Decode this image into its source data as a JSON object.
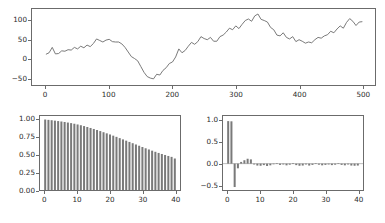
{
  "figure": {
    "background_color": "#ffffff",
    "line_color": "#6b6b6b",
    "bar_color": "#7a7a7a",
    "axis_color": "#6b6b6b",
    "tick_text_color": "#2b2b2b"
  },
  "chart_data": [
    {
      "type": "line",
      "name": "time-series",
      "title": "",
      "xlabel": "",
      "ylabel": "",
      "xlim": [
        -22,
        520
      ],
      "ylim": [
        -68,
        130
      ],
      "xticks": [
        0,
        100,
        200,
        300,
        400,
        500
      ],
      "yticks": [
        -50,
        0,
        50,
        100
      ],
      "xtick_labels": [
        "0",
        "100",
        "200",
        "300",
        "400",
        "500"
      ],
      "ytick_labels": [
        "−50",
        "0",
        "50",
        "100"
      ],
      "grid": false,
      "legend": null,
      "x": [
        0,
        5,
        10,
        15,
        20,
        25,
        30,
        35,
        40,
        45,
        50,
        55,
        60,
        65,
        70,
        75,
        80,
        85,
        90,
        95,
        100,
        105,
        110,
        115,
        120,
        125,
        130,
        135,
        140,
        145,
        150,
        155,
        160,
        165,
        170,
        175,
        180,
        185,
        190,
        195,
        200,
        205,
        210,
        215,
        220,
        225,
        230,
        235,
        240,
        245,
        250,
        255,
        260,
        265,
        270,
        275,
        280,
        285,
        290,
        295,
        300,
        305,
        310,
        315,
        320,
        325,
        330,
        335,
        340,
        345,
        350,
        355,
        360,
        365,
        370,
        375,
        380,
        385,
        390,
        395,
        400,
        405,
        410,
        415,
        420,
        425,
        430,
        435,
        440,
        445,
        450,
        455,
        460,
        465,
        470,
        475,
        480,
        485,
        490,
        495,
        500
      ],
      "y": [
        12,
        16,
        30,
        13,
        14,
        21,
        20,
        24,
        23,
        30,
        26,
        33,
        29,
        36,
        32,
        40,
        52,
        48,
        44,
        49,
        51,
        45,
        44,
        44,
        39,
        30,
        18,
        6,
        1,
        -5,
        -20,
        -35,
        -46,
        -50,
        -52,
        -40,
        -42,
        -30,
        -23,
        -12,
        -8,
        5,
        26,
        16,
        22,
        33,
        43,
        38,
        45,
        58,
        53,
        50,
        56,
        46,
        46,
        58,
        62,
        70,
        80,
        76,
        86,
        79,
        90,
        100,
        104,
        98,
        112,
        117,
        103,
        100,
        96,
        82,
        76,
        62,
        60,
        68,
        56,
        52,
        58,
        45,
        50,
        46,
        41,
        44,
        42,
        50,
        56,
        54,
        60,
        63,
        72,
        68,
        78,
        86,
        80,
        95,
        105,
        98,
        87,
        96,
        97
      ]
    },
    {
      "type": "bar",
      "name": "acf",
      "title": "",
      "xlabel": "",
      "ylabel": "",
      "xlim": [
        -1.6,
        41.6
      ],
      "ylim": [
        0.0,
        1.05
      ],
      "xticks": [
        0,
        10,
        20,
        30,
        40
      ],
      "yticks": [
        0.0,
        0.25,
        0.5,
        0.75,
        1.0
      ],
      "xtick_labels": [
        "0",
        "10",
        "20",
        "30",
        "40"
      ],
      "ytick_labels": [
        "0.00",
        "0.25",
        "0.50",
        "0.75",
        "1.00"
      ],
      "grid": false,
      "legend": null,
      "categories": [
        0,
        1,
        2,
        3,
        4,
        5,
        6,
        7,
        8,
        9,
        10,
        11,
        12,
        13,
        14,
        15,
        16,
        17,
        18,
        19,
        20,
        21,
        22,
        23,
        24,
        25,
        26,
        27,
        28,
        29,
        30,
        31,
        32,
        33,
        34,
        35,
        36,
        37,
        38,
        39,
        40
      ],
      "values": [
        1.0,
        0.995,
        0.99,
        0.984,
        0.978,
        0.972,
        0.965,
        0.957,
        0.949,
        0.94,
        0.93,
        0.919,
        0.907,
        0.894,
        0.88,
        0.866,
        0.851,
        0.836,
        0.82,
        0.804,
        0.788,
        0.771,
        0.754,
        0.736,
        0.718,
        0.7,
        0.682,
        0.664,
        0.646,
        0.628,
        0.61,
        0.592,
        0.575,
        0.558,
        0.542,
        0.526,
        0.511,
        0.497,
        0.483,
        0.47,
        0.447
      ]
    },
    {
      "type": "bar",
      "name": "pacf",
      "title": "",
      "xlabel": "",
      "ylabel": "",
      "xlim": [
        -1.6,
        41.6
      ],
      "ylim": [
        -0.62,
        1.12
      ],
      "xticks": [
        0,
        10,
        20,
        30,
        40
      ],
      "yticks": [
        -0.5,
        0.0,
        0.5,
        1.0
      ],
      "xtick_labels": [
        "0",
        "10",
        "20",
        "30",
        "40"
      ],
      "ytick_labels": [
        "−0.5",
        "0.0",
        "0.5",
        "1.0"
      ],
      "grid": false,
      "legend": null,
      "categories": [
        0,
        1,
        2,
        3,
        4,
        5,
        6,
        7,
        8,
        9,
        10,
        11,
        12,
        13,
        14,
        15,
        16,
        17,
        18,
        19,
        20,
        21,
        22,
        23,
        24,
        25,
        26,
        27,
        28,
        29,
        30,
        31,
        32,
        33,
        34,
        35,
        36,
        37,
        38,
        39,
        40
      ],
      "values": [
        1.0,
        0.995,
        -0.55,
        -0.11,
        0.04,
        0.08,
        0.115,
        0.1,
        -0.02,
        -0.045,
        -0.05,
        -0.035,
        -0.055,
        -0.04,
        -0.015,
        0.01,
        -0.03,
        -0.02,
        -0.04,
        -0.025,
        0.012,
        -0.035,
        -0.05,
        -0.045,
        -0.02,
        -0.045,
        -0.03,
        0.01,
        -0.025,
        -0.04,
        -0.03,
        -0.02,
        -0.035,
        -0.025,
        0.01,
        -0.03,
        -0.04,
        -0.02,
        -0.045,
        -0.05,
        -0.045
      ]
    }
  ]
}
